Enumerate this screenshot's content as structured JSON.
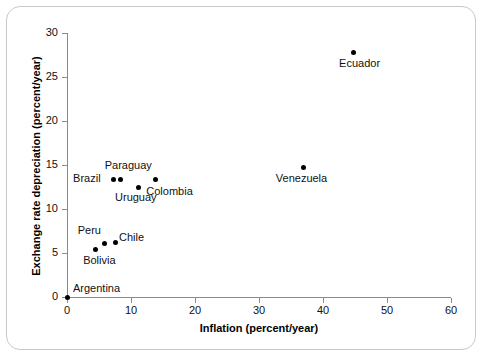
{
  "chart_data": {
    "type": "scatter",
    "title": "",
    "xlabel": "Inflation (percent/year)",
    "ylabel": "Exchange rate depreciation (percent/year)",
    "xlim": [
      0,
      60
    ],
    "ylim": [
      0,
      30
    ],
    "xticks": [
      0,
      10,
      20,
      30,
      40,
      50,
      60
    ],
    "yticks": [
      0,
      5,
      10,
      15,
      20,
      25,
      30
    ],
    "grid": false,
    "legend": "none",
    "point_color": "#000000",
    "axis_color": "#8a8a8a",
    "points": [
      {
        "label": "Argentina",
        "x": 0.0,
        "y": 0.0,
        "label_dx": 6,
        "label_dy": -15
      },
      {
        "label": "Bolivia",
        "x": 4.4,
        "y": 5.4,
        "label_dx": -12,
        "label_dy": 5
      },
      {
        "label": "Peru",
        "x": 5.9,
        "y": 6.1,
        "label_dx": -27,
        "label_dy": -19
      },
      {
        "label": "Chile",
        "x": 7.5,
        "y": 6.2,
        "label_dx": 4,
        "label_dy": -11
      },
      {
        "label": "Brazil",
        "x": 7.2,
        "y": 13.4,
        "label_dx": -40,
        "label_dy": -7
      },
      {
        "label": "Paraguay",
        "x": 8.4,
        "y": 13.4,
        "label_dx": -16,
        "label_dy": -20
      },
      {
        "label": "Uruguay",
        "x": 11.1,
        "y": 12.5,
        "label_dx": -23,
        "label_dy": 4
      },
      {
        "label": "Colombia",
        "x": 13.8,
        "y": 13.4,
        "label_dx": -9,
        "label_dy": 6
      },
      {
        "label": "Venezuela",
        "x": 37.0,
        "y": 14.7,
        "label_dx": -28,
        "label_dy": 4
      },
      {
        "label": "Ecuador",
        "x": 44.7,
        "y": 27.8,
        "label_dx": -14,
        "label_dy": 5
      }
    ]
  }
}
